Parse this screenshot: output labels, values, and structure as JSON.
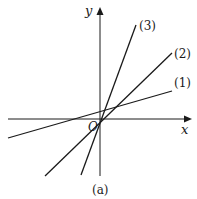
{
  "figure": {
    "caption": "(a)",
    "axes": {
      "x_label": "x",
      "y_label": "y",
      "origin_label": "O"
    },
    "lines": [
      {
        "label": "(1)",
        "description": "shallow positive slope, small positive y-intercept"
      },
      {
        "label": "(2)",
        "description": "moderate positive slope through near origin"
      },
      {
        "label": "(3)",
        "description": "steep positive slope through near origin"
      }
    ],
    "colors": {
      "ink": "#1a1a1a",
      "background": "#ffffff"
    }
  }
}
